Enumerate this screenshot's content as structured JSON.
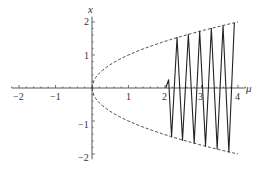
{
  "chart_data": {
    "type": "line",
    "title": "",
    "xlabel": "μ",
    "ylabel": "x",
    "xlim": [
      -2.2,
      4.2
    ],
    "ylim": [
      -2.1,
      2.1
    ],
    "x_ticks": [
      -2,
      -1,
      1,
      2,
      3,
      4
    ],
    "x_tick_labels": [
      "−2",
      "−1",
      "1",
      "2",
      "3",
      "4"
    ],
    "y_ticks": [
      -2,
      -1,
      1,
      2
    ],
    "y_tick_labels": [
      "−2",
      "−1",
      "1",
      "2"
    ],
    "grid": false,
    "legend": null,
    "series": [
      {
        "name": "upper envelope x = √μ",
        "style": "dashed",
        "x": [
          0,
          0.25,
          0.5,
          1,
          1.5,
          2,
          2.5,
          3,
          3.5,
          4
        ],
        "y": [
          0,
          0.5,
          0.71,
          1,
          1.22,
          1.41,
          1.58,
          1.73,
          1.87,
          2
        ]
      },
      {
        "name": "lower envelope x = −√μ",
        "style": "dashed",
        "x": [
          0,
          0.25,
          0.5,
          1,
          1.5,
          2,
          2.5,
          3,
          3.5,
          4
        ],
        "y": [
          0,
          -0.5,
          -0.71,
          -1,
          -1.22,
          -1.41,
          -1.58,
          -1.73,
          -1.87,
          -2
        ]
      },
      {
        "name": "oscillating solution",
        "style": "solid",
        "x": [
          2.02,
          2.1,
          2.18,
          2.33,
          2.48,
          2.64,
          2.8,
          2.95,
          3.11,
          3.27,
          3.43,
          3.59,
          3.75,
          3.9
        ],
        "y": [
          0,
          0.25,
          -1.48,
          1.53,
          -1.58,
          1.62,
          -1.67,
          1.72,
          -1.76,
          1.81,
          -1.85,
          1.89,
          -1.94,
          1.98
        ]
      }
    ]
  },
  "labels": {
    "x_axis_name": "μ",
    "y_axis_name": "x",
    "x_ticks": [
      "−2",
      "−1",
      "1",
      "2",
      "3",
      "4"
    ],
    "y_ticks": [
      "2",
      "1",
      "−1",
      "−2"
    ]
  }
}
